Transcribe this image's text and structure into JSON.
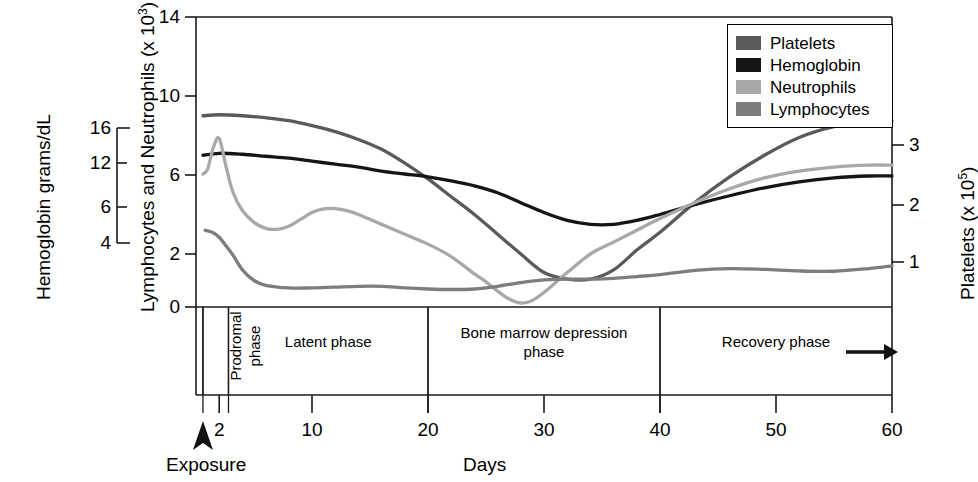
{
  "figure": {
    "xlabel": "Days",
    "exposure_label": "Exposure",
    "left_axis_primary_title": "Lymphocytes and Neutrophils (x 10",
    "left_axis_primary_exp": "3",
    "left_axis_primary_close": ")",
    "left_axis_secondary_title": "Hemoglobin grams/dL",
    "right_axis_title": "Platelets (x 10",
    "right_axis_exp": "5",
    "right_axis_close": ")"
  },
  "legend": {
    "entries": [
      {
        "label": "Platelets",
        "color": "#5a5a5a"
      },
      {
        "label": "Hemoglobin",
        "color": "#151515"
      },
      {
        "label": "Neutrophils",
        "color": "#a8a8a8"
      },
      {
        "label": "Lymphocytes",
        "color": "#7d7d7d"
      }
    ]
  },
  "chart_data": {
    "type": "line",
    "title": "",
    "xlabel": "Days",
    "ylabel": "Lymphocytes and Neutrophils (x 10^3)",
    "y2label": "Platelets (x 10^5)",
    "y3label": "Hemoglobin grams/dL",
    "grid": false,
    "legend_position": "top-right",
    "xlim": [
      0,
      60
    ],
    "xticks": [
      2,
      10,
      20,
      30,
      40,
      50,
      60
    ],
    "ylim": [
      0,
      14
    ],
    "yticks": [
      0,
      2,
      6,
      10,
      14
    ],
    "y2ticks": [
      1,
      2,
      3
    ],
    "y3ticks": [
      4,
      6,
      12,
      16
    ],
    "exposure_day": 0,
    "annotations": [
      {
        "text": "Prodromal phase",
        "from_day": 0.6,
        "to_day": 2.8,
        "orientation": "vertical"
      },
      {
        "text": "Latent phase",
        "from_day": 2.8,
        "to_day": 20,
        "orientation": "horizontal"
      },
      {
        "text": "Bone marrow depression phase",
        "from_day": 20,
        "to_day": 40,
        "orientation": "horizontal"
      },
      {
        "text": "Recovery phase",
        "from_day": 40,
        "to_day": 60,
        "orientation": "horizontal"
      }
    ],
    "series": [
      {
        "name": "Platelets",
        "color": "#5a5a5a",
        "x": [
          0.6,
          2,
          4,
          6,
          8,
          10,
          12,
          14,
          16,
          18,
          20,
          22,
          24,
          26,
          28,
          30,
          32,
          34,
          36,
          38,
          40,
          43,
          46,
          49,
          52,
          55,
          58,
          60
        ],
        "y": [
          9.0,
          9.05,
          9.0,
          8.9,
          8.75,
          8.5,
          8.2,
          7.8,
          7.3,
          6.6,
          5.8,
          4.9,
          4.0,
          3.0,
          2.0,
          1.3,
          1.05,
          1.05,
          1.4,
          2.2,
          3.1,
          4.6,
          5.9,
          7.0,
          7.9,
          8.45,
          8.7,
          8.75
        ]
      },
      {
        "name": "Hemoglobin",
        "color": "#151515",
        "x": [
          0.6,
          2,
          4,
          6,
          8,
          10,
          12,
          14,
          16,
          18,
          20,
          22,
          24,
          26,
          28,
          30,
          32,
          34,
          36,
          38,
          40,
          43,
          46,
          49,
          52,
          55,
          58,
          60
        ],
        "y": [
          7.0,
          7.1,
          7.05,
          6.95,
          6.85,
          6.7,
          6.55,
          6.4,
          6.2,
          6.05,
          5.9,
          5.7,
          5.45,
          5.1,
          4.6,
          4.1,
          3.7,
          3.5,
          3.5,
          3.7,
          4.0,
          4.5,
          4.95,
          5.35,
          5.65,
          5.85,
          5.95,
          5.95
        ]
      },
      {
        "name": "Neutrophils",
        "color": "#a8a8a8",
        "x": [
          0.6,
          1.0,
          1.5,
          2.0,
          2.6,
          3.2,
          4,
          5,
          6,
          7,
          8,
          9,
          10,
          11,
          12,
          13,
          14,
          16,
          18,
          20,
          22,
          24,
          25,
          26,
          27,
          28,
          29,
          30,
          32,
          34,
          36,
          38,
          40,
          43,
          46,
          49,
          52,
          55,
          58,
          60
        ],
        "y": [
          6.05,
          6.3,
          7.4,
          7.85,
          6.4,
          5.1,
          4.2,
          3.6,
          3.3,
          3.25,
          3.4,
          3.75,
          4.1,
          4.28,
          4.3,
          4.2,
          4.0,
          3.5,
          3.0,
          2.5,
          1.9,
          1.25,
          0.95,
          0.6,
          0.3,
          0.15,
          0.25,
          0.55,
          1.3,
          2.0,
          2.6,
          3.2,
          3.8,
          4.6,
          5.3,
          5.85,
          6.2,
          6.4,
          6.5,
          6.5
        ]
      },
      {
        "name": "Lymphocytes",
        "color": "#7d7d7d",
        "x": [
          0.8,
          1.4,
          2,
          2.6,
          3.2,
          4,
          5,
          6,
          8,
          10,
          12,
          14,
          16,
          18,
          20,
          22,
          24,
          26,
          28,
          30,
          32,
          34,
          36,
          38,
          40,
          43,
          46,
          49,
          52,
          55,
          58,
          60
        ],
        "y": [
          3.2,
          3.1,
          2.85,
          2.4,
          1.95,
          1.4,
          1.0,
          0.82,
          0.72,
          0.72,
          0.75,
          0.78,
          0.78,
          0.72,
          0.68,
          0.66,
          0.68,
          0.78,
          0.92,
          1.02,
          1.05,
          1.05,
          1.08,
          1.15,
          1.22,
          1.38,
          1.45,
          1.42,
          1.36,
          1.35,
          1.45,
          1.55
        ]
      }
    ]
  }
}
